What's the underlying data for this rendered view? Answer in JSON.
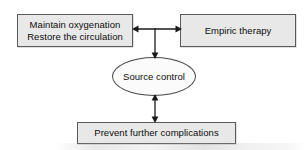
{
  "figure": {
    "colors": {
      "box_fill": "#e8e8e8",
      "box_border": "#5a5a5a",
      "ellipse_fill": "#fbfbfb",
      "ellipse_border": "#4a4a4a",
      "text": "#0d0d0d",
      "connector": "#1a1a1a",
      "background": "#ffffff"
    }
  },
  "nodes": {
    "oxygenation": {
      "label": "Maintain oxygenation\nRestore the circulation",
      "shape": "rectangle"
    },
    "empiric": {
      "label": "Empiric therapy",
      "shape": "rectangle"
    },
    "source_control": {
      "label": "Source control",
      "shape": "ellipse"
    },
    "prevent": {
      "label": "Prevent further complications",
      "shape": "rectangle"
    }
  },
  "connectors": [
    {
      "name": "oxygenation-empiric",
      "from": "oxygenation",
      "to": "empiric",
      "orientation": "horizontal",
      "arrowheads": "both"
    },
    {
      "name": "junction-source-control",
      "from": "oxygenation-empiric-midpoint",
      "to": "source_control",
      "orientation": "vertical",
      "arrowheads": "end"
    },
    {
      "name": "source-control-prevent",
      "from": "source_control",
      "to": "prevent",
      "orientation": "vertical",
      "arrowheads": "both"
    }
  ]
}
